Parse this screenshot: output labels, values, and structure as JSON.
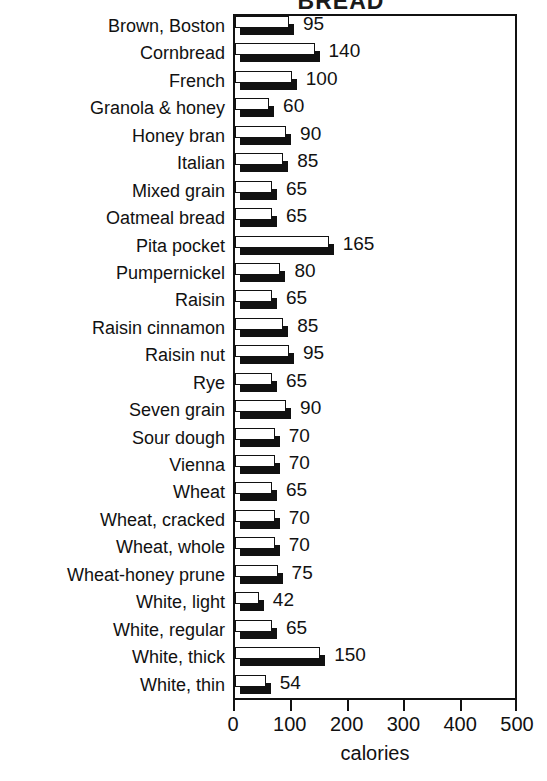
{
  "chart_data": {
    "type": "bar",
    "orientation": "horizontal",
    "title": "BREAD",
    "xlabel": "calories",
    "ylabel": "",
    "xlim": [
      0,
      500
    ],
    "xticks": [
      0,
      100,
      200,
      300,
      400,
      500
    ],
    "xtick_labels": [
      "0",
      "100",
      "200",
      "300",
      "400",
      "500"
    ],
    "grid": false,
    "legend": null,
    "bar_style": "3d-white-face-black-shadow",
    "categories": [
      "Brown, Boston",
      "Cornbread",
      "French",
      "Granola & honey",
      "Honey bran",
      "Italian",
      "Mixed grain",
      "Oatmeal bread",
      "Pita pocket",
      "Pumpernickel",
      "Raisin",
      "Raisin cinnamon",
      "Raisin nut",
      "Rye",
      "Seven grain",
      "Sour dough",
      "Vienna",
      "Wheat",
      "Wheat, cracked",
      "Wheat, whole",
      "Wheat-honey prune",
      "White, light",
      "White, regular",
      "White, thick",
      "White, thin"
    ],
    "values": [
      95,
      140,
      100,
      60,
      90,
      85,
      65,
      65,
      165,
      80,
      65,
      85,
      95,
      65,
      90,
      70,
      70,
      65,
      70,
      70,
      75,
      42,
      65,
      150,
      54
    ],
    "value_labels": [
      "95",
      "140",
      "100",
      "60",
      "90",
      "85",
      "65",
      "65",
      "165",
      "80",
      "65",
      "85",
      "95",
      "65",
      "90",
      "70",
      "70",
      "65",
      "70",
      "70",
      "75",
      "42",
      "65",
      "150",
      "54"
    ],
    "colors": {
      "bar_face": "#ffffff",
      "bar_outline": "#111111",
      "bar_shadow": "#111111",
      "axis": "#111111",
      "text": "#111111",
      "background": "#ffffff"
    }
  }
}
